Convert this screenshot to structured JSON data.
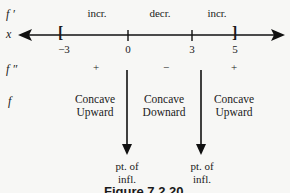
{
  "rows": {
    "fprime_label": "f ′",
    "x_label": "x",
    "fdouble_label": "f ″",
    "f_label": "f"
  },
  "fprime_signs": [
    "incr.",
    "decr.",
    "incr."
  ],
  "number_line": {
    "ticks": [
      "−3",
      "0",
      "3",
      "5"
    ],
    "left_bracket": "[",
    "right_bracket": "]"
  },
  "fdouble_signs": [
    "+",
    "−",
    "+"
  ],
  "concavity": [
    {
      "line1": "Concave",
      "line2": "Upward"
    },
    {
      "line1": "Concave",
      "line2": "Downard"
    },
    {
      "line1": "Concave",
      "line2": "Upward"
    }
  ],
  "inflection_points": [
    {
      "line1": "pt. of",
      "line2": "infl."
    },
    {
      "line1": "pt. of",
      "line2": "infl."
    }
  ],
  "caption": "Figure 7.2.20"
}
